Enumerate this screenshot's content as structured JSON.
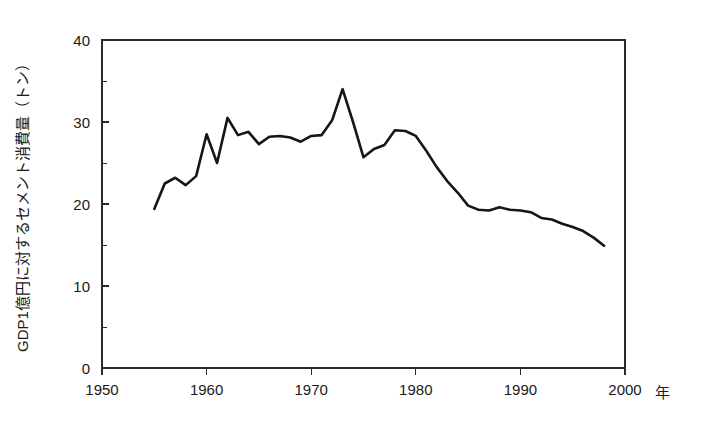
{
  "chart_data": {
    "type": "line",
    "title": "",
    "xlabel": "年",
    "ylabel": "GDP1億円に対するセメント消費量（トン）",
    "xlim": [
      1950,
      2000
    ],
    "ylim": [
      0,
      40
    ],
    "xticks": [
      1950,
      1960,
      1970,
      1980,
      1990,
      2000
    ],
    "xtick_labels": [
      "1950",
      "1960",
      "1970",
      "1980",
      "1990",
      "2000"
    ],
    "yticks": [
      0,
      10,
      20,
      30,
      40
    ],
    "ytick_labels": [
      "0",
      "10",
      "20",
      "30",
      "40"
    ],
    "y_minor_ticks": [
      5,
      15,
      25,
      35
    ],
    "grid": false,
    "legend": "none",
    "line_color": "#161616",
    "axis_color": "#2b2b2b",
    "background_color": "#ffffff",
    "series": [
      {
        "name": "GDP1億円に対するセメント消費量",
        "x": [
          1955,
          1956,
          1957,
          1958,
          1959,
          1960,
          1961,
          1962,
          1963,
          1964,
          1965,
          1966,
          1967,
          1968,
          1969,
          1970,
          1971,
          1972,
          1973,
          1974,
          1975,
          1976,
          1977,
          1978,
          1979,
          1980,
          1981,
          1982,
          1983,
          1984,
          1985,
          1986,
          1987,
          1988,
          1989,
          1990,
          1991,
          1992,
          1993,
          1994,
          1995,
          1996,
          1997,
          1998
        ],
        "values": [
          19.4,
          22.5,
          23.2,
          22.3,
          23.4,
          28.5,
          25.0,
          30.5,
          28.4,
          28.8,
          27.3,
          28.2,
          28.3,
          28.1,
          27.6,
          28.3,
          28.4,
          30.2,
          34.0,
          30.0,
          25.7,
          26.7,
          27.2,
          29.0,
          28.9,
          28.3,
          26.5,
          24.5,
          22.8,
          21.4,
          19.8,
          19.3,
          19.2,
          19.6,
          19.3,
          19.2,
          19.0,
          18.3,
          18.1,
          17.6,
          17.2,
          16.7,
          15.9,
          14.9
        ]
      }
    ]
  },
  "axis_labels": {
    "y_title": "GDP1億円に対するセメント消費量（トン）",
    "x_unit": "年"
  }
}
